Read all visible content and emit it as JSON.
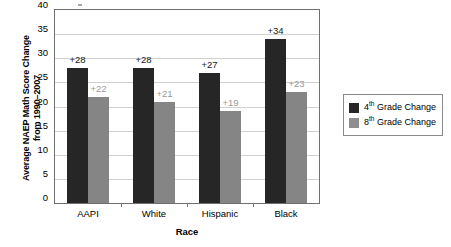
{
  "chart_data": {
    "type": "bar",
    "title": "",
    "xlabel": "Race",
    "ylabel_line1": "Average NAEP Math Score Change",
    "ylabel_line2": "from 1990–2007",
    "categories": [
      "AAPI",
      "White",
      "Hispanic",
      "Black"
    ],
    "series": [
      {
        "name": "4th Grade Change",
        "name_prefix": "4",
        "name_sup": "th",
        "name_suffix": " Grade Change",
        "color": "#262626",
        "values": [
          28,
          28,
          27,
          34
        ],
        "labels": [
          "+28",
          "+28",
          "+27",
          "+34"
        ]
      },
      {
        "name": "8th Grade Change",
        "name_prefix": "8",
        "name_sup": "th",
        "name_suffix": " Grade Change",
        "color": "#858585",
        "values": [
          22,
          21,
          19,
          23
        ],
        "labels": [
          "+22",
          "+21",
          "+19",
          "+23"
        ]
      }
    ],
    "ylim": [
      0,
      40
    ],
    "yticks": [
      0,
      5,
      10,
      15,
      20,
      25,
      30,
      35,
      40
    ],
    "ytick_labels": [
      "0",
      "5",
      "10",
      "15",
      "20",
      "25",
      "30",
      "35",
      "40"
    ],
    "grid": true,
    "grid_axis": "y",
    "legend_position": "right-outside"
  }
}
